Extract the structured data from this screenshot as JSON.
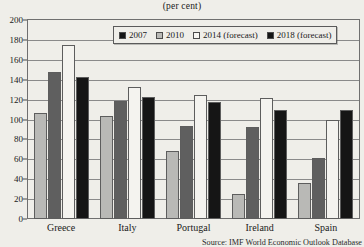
{
  "chart_data": {
    "type": "bar",
    "title": "(per cent)",
    "xlabel": "",
    "ylabel": "",
    "ylim": [
      0,
      200
    ],
    "ytick_step": 20,
    "yticks": [
      "0",
      "20",
      "40",
      "60",
      "80",
      "100",
      "120",
      "140",
      "160",
      "180",
      "200"
    ],
    "grid": true,
    "legend_position": "top-center",
    "categories": [
      "Greece",
      "Italy",
      "Portugal",
      "Ireland",
      "Spain"
    ],
    "series": [
      {
        "name": "2007",
        "color": "#151515",
        "values": [
          107,
          104,
          68,
          25,
          36
        ]
      },
      {
        "name": "2010",
        "color": "#b9b9b6",
        "values": [
          148,
          119,
          93,
          92,
          61
        ]
      },
      {
        "name": "2014 (forecast)",
        "color": "#f7f6f2",
        "values": [
          175,
          133,
          125,
          122,
          100
        ]
      },
      {
        "name": "2018 (forecast)",
        "color": "#151515",
        "values": [
          143,
          123,
          118,
          110,
          110
        ]
      }
    ],
    "source": "Source: IMF World Economic Outlook Database"
  },
  "legend": {
    "entries": [
      "2007",
      "2010",
      "2014 (forecast)",
      "2018 (forecast)"
    ]
  }
}
